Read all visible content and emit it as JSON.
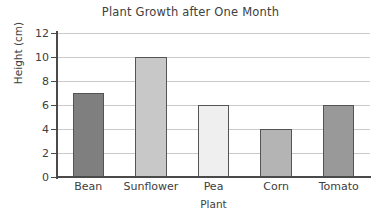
{
  "chart_data": {
    "type": "bar",
    "title": "Plant Growth after One Month",
    "xlabel": "Plant",
    "ylabel": "Height (cm)",
    "categories": [
      "Bean",
      "Sunflower",
      "Pea",
      "Corn",
      "Tomato"
    ],
    "values": [
      7,
      10,
      6,
      4,
      6
    ],
    "bar_colors": [
      "#7f7f7f",
      "#c8c8c8",
      "#efefef",
      "#b4b4b4",
      "#999999"
    ],
    "bar_edge_color": "#545454",
    "ylim": [
      0,
      12
    ],
    "ytick_values": [
      0,
      2,
      4,
      6,
      8,
      10,
      12
    ],
    "ytick_labels": [
      "0",
      "2",
      "4",
      "6",
      "8",
      "10",
      "12"
    ],
    "grid": true,
    "gridline_color": "#c9c9c9",
    "legend": null,
    "legend_position": "none",
    "axis_color": "#4a4a4a",
    "background_color": "#ffffff"
  }
}
